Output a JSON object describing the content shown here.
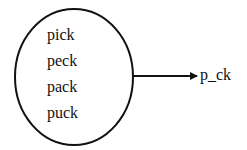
{
  "diagram": {
    "set_items": [
      "pick",
      "peck",
      "pack",
      "puck"
    ],
    "pattern_label": "p_ck",
    "colors": {
      "stroke": "#111111",
      "background": "#ffffff"
    }
  }
}
